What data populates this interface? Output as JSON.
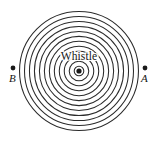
{
  "figure": {
    "name": "whistle-wavefront-diagram",
    "background_color": "#ffffff",
    "stroke_color": "#2b2b2b",
    "width": 158,
    "height": 143
  },
  "source": {
    "label": "Whistle",
    "center_x": 79,
    "center_y": 71,
    "dot_radius": 2.6
  },
  "wavefronts": {
    "count": 12,
    "innermost_radius": 4.8,
    "outermost_radius": 59.5,
    "spacing": 4.97,
    "shape": "circle"
  },
  "observers": [
    {
      "label": "A",
      "name": "observer-a",
      "dot_x": 145,
      "dot_y": 68,
      "dot_radius": 2.4,
      "side": "right"
    },
    {
      "label": "B",
      "name": "observer-b",
      "dot_x": 13,
      "dot_y": 68,
      "dot_radius": 2.4,
      "side": "left"
    }
  ]
}
